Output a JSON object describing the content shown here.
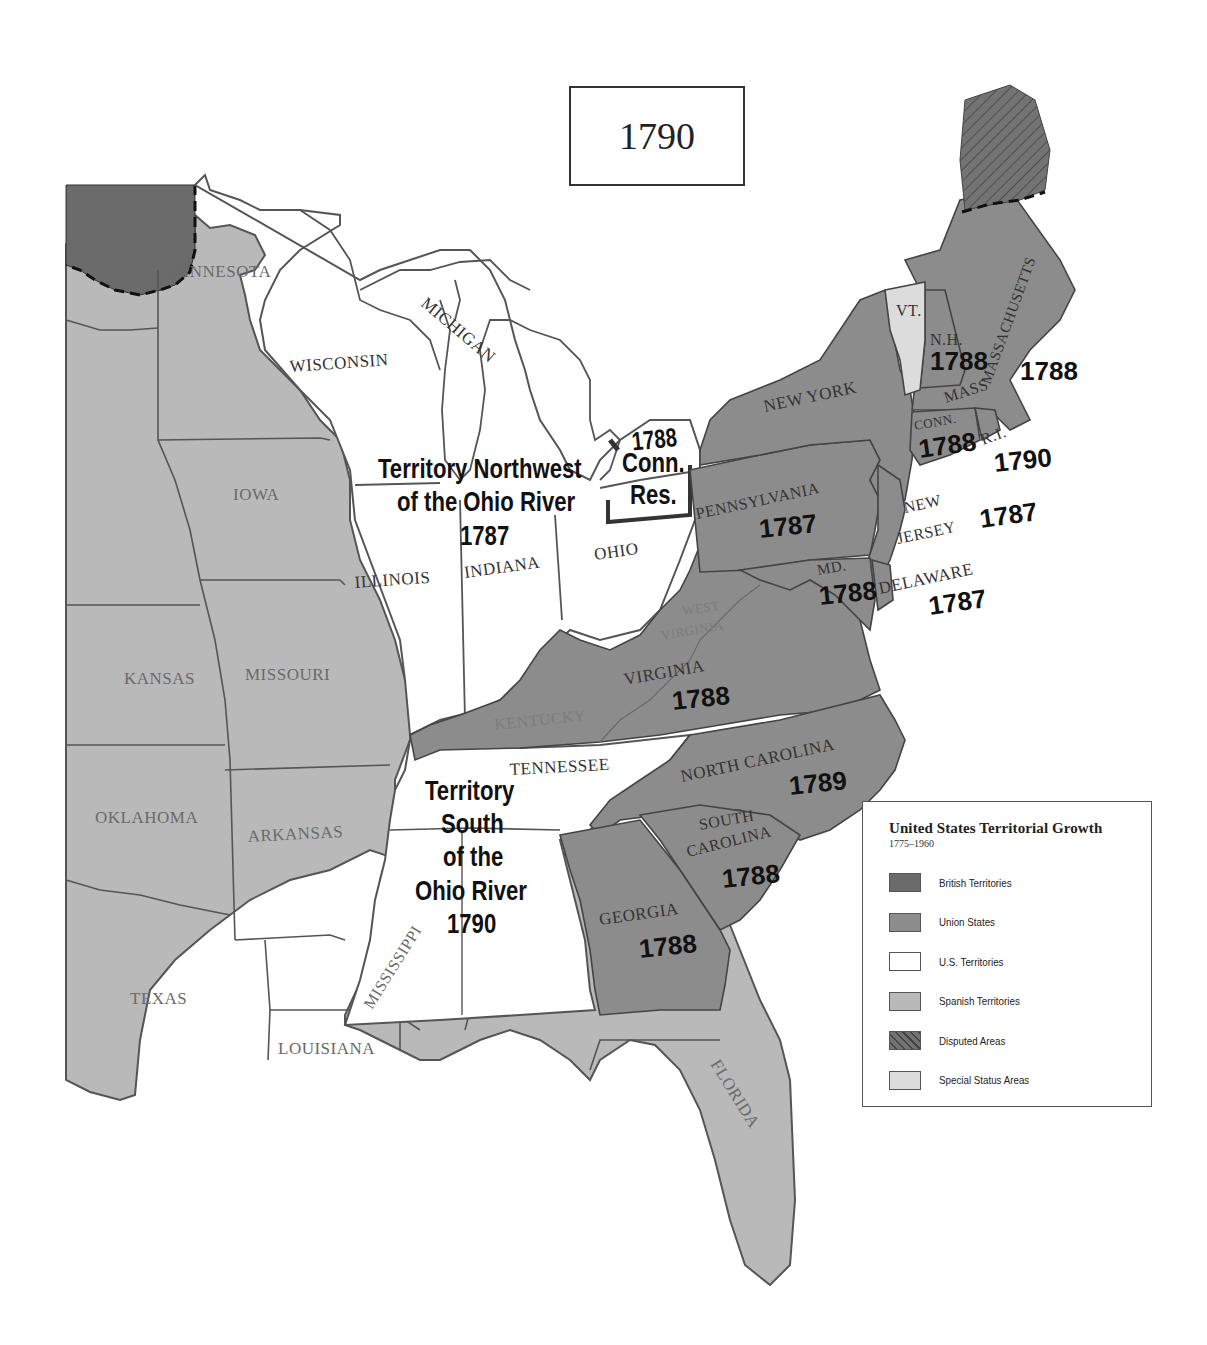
{
  "map": {
    "year": "1790",
    "colors": {
      "british": "#6b6b6b",
      "union": "#8c8c8c",
      "us_territory": "#ffffff",
      "spanish": "#b9b9b9",
      "disputed": "#707070",
      "special": "#dcdcdc",
      "border": "#555555"
    },
    "regions": {
      "minnesota": "MINNESOTA",
      "wisconsin": "WISCONSIN",
      "michigan": "MICHIGAN",
      "iowa": "IOWA",
      "illinois": "ILLINOIS",
      "indiana": "INDIANA",
      "ohio": "OHIO",
      "kansas": "KANSAS",
      "missouri": "MISSOURI",
      "oklahoma": "OKLAHOMA",
      "arkansas": "ARKANSAS",
      "texas": "TEXAS",
      "louisiana": "LOUISIANA",
      "mississippi": "MISSISSIPPI",
      "florida": "FLORIDA",
      "kentucky": "KENTUCKY",
      "west_virginia_1": "WEST",
      "west_virginia_2": "VIRGINIA",
      "tennessee": "TENNESSEE"
    },
    "states": {
      "new_york": {
        "name": "NEW YORK",
        "year": "1788"
      },
      "pennsylvania": {
        "name": "PENNSYLVANIA",
        "year": "1787"
      },
      "new_jersey": {
        "name_1": "NEW",
        "name_2": "JERSEY",
        "year": "1787"
      },
      "delaware": {
        "name": "DELAWARE",
        "year": "1787"
      },
      "maryland": {
        "name": "MD.",
        "year": "1788"
      },
      "virginia": {
        "name": "VIRGINIA",
        "year": "1788"
      },
      "north_carolina": {
        "name": "NORTH CAROLINA",
        "year": "1789"
      },
      "south_carolina": {
        "name_1": "SOUTH",
        "name_2": "CAROLINA",
        "year": "1788"
      },
      "georgia": {
        "name": "GEORGIA",
        "year": "1788"
      },
      "vermont": {
        "name": "VT."
      },
      "new_hampshire": {
        "name": "N.H.",
        "year": "1788"
      },
      "massachusetts": {
        "name_1": "MASSACHUSETTS",
        "name_2": "MASS",
        "year": "1788"
      },
      "connecticut": {
        "name": "CONN.",
        "year": "1788"
      },
      "rhode_island": {
        "name": "R.I.",
        "year": "1790"
      }
    },
    "territories": {
      "northwest": {
        "line_1": "Territory Northwest",
        "line_2": "of the Ohio River",
        "year": "1787"
      },
      "south": {
        "line_1": "Territory",
        "line_2": "South",
        "line_3": "of the",
        "line_4": "Ohio River",
        "year": "1790"
      },
      "conn_reserve": {
        "line_1": "Conn.",
        "line_2": "Res."
      }
    }
  },
  "legend": {
    "title": "United States Territorial Growth",
    "subtitle": "1775–1960",
    "items": [
      {
        "label": "British Territories",
        "color": "#6b6b6b"
      },
      {
        "label": "Union States",
        "color": "#8c8c8c"
      },
      {
        "label": "U.S. Territories",
        "color": "#ffffff"
      },
      {
        "label": "Spanish Territories",
        "color": "#b9b9b9"
      },
      {
        "label": "Disputed Areas",
        "color": "#707070"
      },
      {
        "label": "Special Status Areas",
        "color": "#dcdcdc"
      }
    ]
  }
}
